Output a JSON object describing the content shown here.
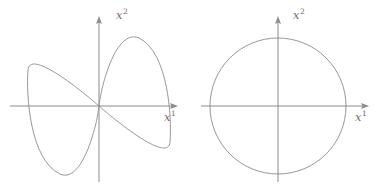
{
  "figure": {
    "background_color": "#ffffff",
    "stroke_color": "#8c8c8c",
    "label_color": "#6d6d6d",
    "width": 383,
    "height": 192,
    "panel_count": 2
  },
  "panels": [
    {
      "id": "left-panel",
      "curve_name": "lemniscate",
      "x_axis_label_base": "x",
      "x_axis_label_sup": "1",
      "y_axis_label_base": "x",
      "y_axis_label_sup": "2",
      "origin": {
        "x": 99,
        "y": 106
      },
      "x_axis": {
        "start_x": 10,
        "end_x": 178,
        "y": 106,
        "arrow": "right"
      },
      "y_axis": {
        "x": 99,
        "start_y": 182,
        "end_y": 16,
        "arrow": "up"
      },
      "curve": {
        "type": "lemniscate-of-gerono",
        "half_width": 72,
        "half_height": 70,
        "lobe_left_extent": 27,
        "lobe_right_extent": 171,
        "lobe_top": 38,
        "lobe_bottom": 177,
        "crosses_at_origin": true
      }
    },
    {
      "id": "right-panel",
      "curve_name": "circle",
      "x_axis_label_base": "x",
      "x_axis_label_sup": "1",
      "y_axis_label_base": "x",
      "y_axis_label_sup": "2",
      "origin": {
        "x": 278,
        "y": 106
      },
      "x_axis": {
        "start_x": 201,
        "end_x": 369,
        "y": 106,
        "arrow": "right"
      },
      "y_axis": {
        "x": 278,
        "start_y": 182,
        "end_y": 16,
        "arrow": "up"
      },
      "curve": {
        "type": "circle",
        "center_x": 278,
        "center_y": 106,
        "radius": 68,
        "left_extent": 210,
        "right_extent": 346,
        "top": 38,
        "bottom": 174
      }
    }
  ],
  "labels": {
    "left_x_axis": {
      "base": "x",
      "sup": "1"
    },
    "left_y_axis": {
      "base": "x",
      "sup": "2"
    },
    "right_x_axis": {
      "base": "x",
      "sup": "1"
    },
    "right_y_axis": {
      "base": "x",
      "sup": "2"
    }
  }
}
